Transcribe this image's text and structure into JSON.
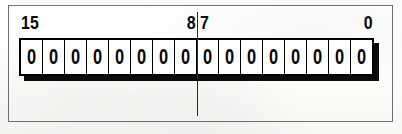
{
  "figure": {
    "kind": "register-bit-diagram",
    "bit_width": 16,
    "bit_cells": [
      {
        "index": 15,
        "value": "0"
      },
      {
        "index": 14,
        "value": "0"
      },
      {
        "index": 13,
        "value": "0"
      },
      {
        "index": 12,
        "value": "0"
      },
      {
        "index": 11,
        "value": "0"
      },
      {
        "index": 10,
        "value": "0"
      },
      {
        "index": 9,
        "value": "0"
      },
      {
        "index": 8,
        "value": "0"
      },
      {
        "index": 7,
        "value": "0"
      },
      {
        "index": 6,
        "value": "0"
      },
      {
        "index": 5,
        "value": "0"
      },
      {
        "index": 4,
        "value": "0"
      },
      {
        "index": 3,
        "value": "0"
      },
      {
        "index": 2,
        "value": "0"
      },
      {
        "index": 1,
        "value": "0"
      },
      {
        "index": 0,
        "value": "0"
      }
    ],
    "bit_labels": {
      "leftmost": "15",
      "high_byte_low_end": "8",
      "low_byte_high_end": "7",
      "rightmost": "0"
    },
    "colors": {
      "ink": "#000000",
      "shadow": "#0b0b0b",
      "cell_fill": "#ffffff",
      "paper": "#fdfdfc",
      "frame_line": "#6f6f6f",
      "divider_line": "#2a2a2a"
    }
  }
}
